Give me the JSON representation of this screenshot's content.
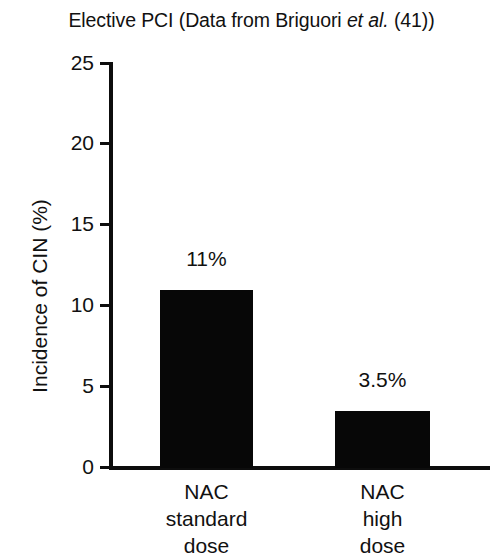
{
  "chart_data": {
    "type": "bar",
    "title": "Elective PCI (Data from Briguori et al. (41))",
    "title_parts": {
      "before": "Elective PCI (Data from Briguori ",
      "italic": "et al.",
      "after": " (41))"
    },
    "categories": [
      "NAC standard dose",
      "NAC high dose"
    ],
    "category_lines": [
      [
        "NAC",
        "standard",
        "dose"
      ],
      [
        "NAC",
        "high",
        "dose"
      ]
    ],
    "values": [
      11,
      3.5
    ],
    "value_labels": [
      "11%",
      "3.5%"
    ],
    "xlabel": "",
    "ylabel": "Incidence of CIN (%)",
    "ylim": [
      0,
      25
    ],
    "yticks": [
      0,
      5,
      10,
      15,
      20,
      25
    ],
    "ytick_labels": [
      "0",
      "5",
      "10",
      "15",
      "20",
      "25"
    ],
    "grid": false,
    "legend": false,
    "bar_color": "#070707",
    "axis_color": "#0d0d0d",
    "background_color": "#ffffff",
    "text_color": "#111111"
  }
}
